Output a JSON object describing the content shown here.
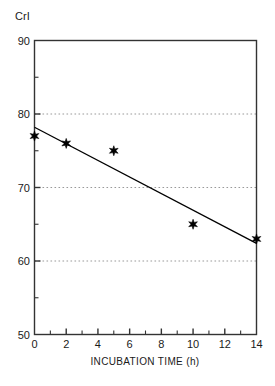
{
  "chart_data": {
    "type": "scatter",
    "title": "",
    "xlabel": "INCUBATION TIME (h)",
    "ylabel": "CrI",
    "xlim": [
      0,
      14
    ],
    "ylim": [
      50,
      90
    ],
    "xticks": [
      0,
      2,
      4,
      6,
      8,
      10,
      12,
      14
    ],
    "xtick_labels": [
      "0",
      "2",
      "4",
      "6",
      "8",
      "10",
      "12",
      "14"
    ],
    "yticks": [
      50,
      60,
      70,
      80,
      90
    ],
    "ytick_labels": [
      "50",
      "60",
      "70",
      "80",
      "90"
    ],
    "x_minor_tick_step": 1,
    "y_minor_tick_step": 5,
    "grid": {
      "enabled": true,
      "axis": "y",
      "style": "dotted",
      "values": [
        60,
        70,
        80
      ],
      "color": "#999999"
    },
    "legend": {
      "visible": false,
      "position": "none"
    },
    "frame": {
      "visible": true,
      "color": "#333333"
    },
    "series": [
      {
        "name": "CrI measurements",
        "type": "scatter",
        "marker": "star",
        "color": "#000000",
        "x": [
          0,
          2,
          5,
          10,
          14
        ],
        "values": [
          77,
          76,
          75,
          65,
          63
        ],
        "points": [
          {
            "x": 0,
            "y": 77
          },
          {
            "x": 2,
            "y": 76
          },
          {
            "x": 5,
            "y": 75
          },
          {
            "x": 10,
            "y": 65
          },
          {
            "x": 14,
            "y": 63
          }
        ]
      },
      {
        "name": "Linear fit",
        "type": "line",
        "color": "#000000",
        "x": [
          0,
          14
        ],
        "values": [
          78.2,
          62.4
        ]
      }
    ]
  },
  "axes": {
    "y_title": "CrI",
    "x_title": "INCUBATION TIME (h)"
  }
}
